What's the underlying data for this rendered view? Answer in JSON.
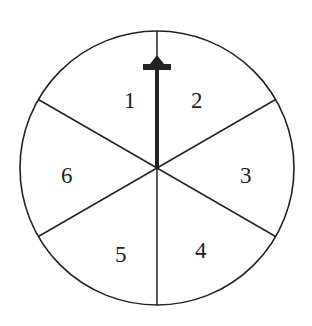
{
  "diagram": {
    "type": "spinner",
    "sections": [
      {
        "label": "1"
      },
      {
        "label": "2"
      },
      {
        "label": "3"
      },
      {
        "label": "4"
      },
      {
        "label": "5"
      },
      {
        "label": "6"
      }
    ],
    "pointer": {
      "direction": "up",
      "between": [
        "1",
        "2"
      ]
    },
    "colors": {
      "stroke": "#222222",
      "background": "#ffffff"
    }
  }
}
